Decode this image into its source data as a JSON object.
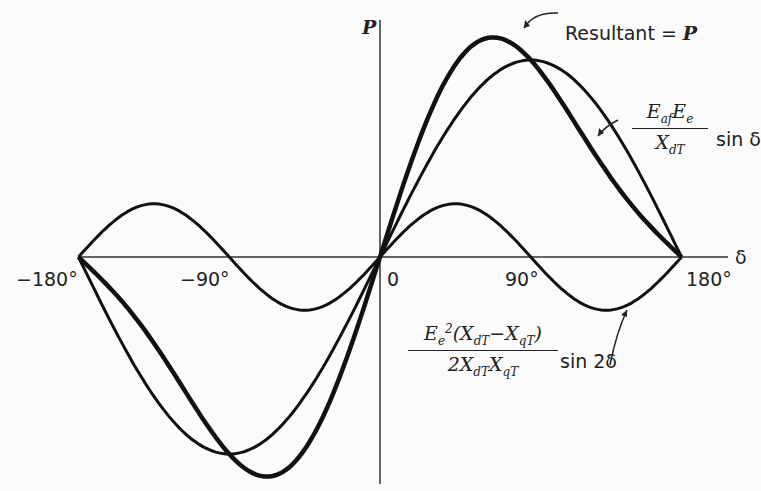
{
  "axes": {
    "y_label": "P",
    "x_label": "δ",
    "x_ticks": [
      "−180°",
      "−90°",
      "0",
      "90°",
      "180°"
    ]
  },
  "annotations": {
    "resultant": "Resultant = P",
    "sin_term": {
      "num": "E_af E_e",
      "den": "X_dT",
      "suffix": "sin δ"
    },
    "sin2_term": {
      "num": "E_e^2 (X_dT − X_qT)",
      "den": "2 X_dT X_qT",
      "suffix": "sin 2δ"
    }
  },
  "chart_data": {
    "type": "line",
    "title": "",
    "xlabel": "δ",
    "ylabel": "P",
    "x_range": [
      -180,
      180
    ],
    "x_ticks": [
      -180,
      -90,
      0,
      90,
      180
    ],
    "grid": false,
    "series": [
      {
        "name": "E_af E_e / X_dT · sin δ",
        "amplitude": 1.0,
        "function": "sin(δ)"
      },
      {
        "name": "E_e²(X_dT−X_qT)/(2 X_dT X_qT) · sin 2δ",
        "amplitude": 0.27,
        "function": "sin(2δ)"
      },
      {
        "name": "Resultant = P",
        "function": "sin(δ) + 0.27·sin(2δ)",
        "peak": {
          "x": 70,
          "y": 1.13
        }
      }
    ]
  }
}
